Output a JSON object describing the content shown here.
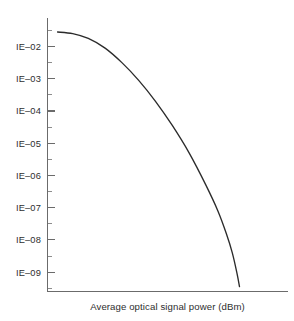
{
  "chart_data": {
    "type": "line",
    "title": "",
    "subtitle": "",
    "xlabel": "Average optical signal power (dBm)",
    "ylabel": "",
    "grid": false,
    "legend": null,
    "legend_position": "none",
    "yscale": "log",
    "xscale": "linear",
    "y_tick_labels": [
      "IE–02",
      "IE–03",
      "IE–04",
      "IE–05",
      "IE–06",
      "IE–07",
      "IE–08",
      "IE–09"
    ],
    "y_tick_values": [
      0.01,
      0.001,
      0.0001,
      1e-05,
      1e-06,
      1e-07,
      1e-08,
      1e-09
    ],
    "y_minor_ticks_per_decade": 1,
    "x_tick_labels": [],
    "ylim_exponent": [
      -9.6,
      -1.1
    ],
    "xlim": [
      0,
      1
    ],
    "series": [
      {
        "name": "bit error rate curve",
        "color": "#2b2b2b",
        "x": [
          0.042,
          0.105,
          0.17,
          0.24,
          0.31,
          0.38,
          0.45,
          0.52,
          0.59,
          0.66,
          0.71,
          0.745,
          0.77,
          0.79,
          0.8
        ],
        "y_exponent": [
          -1.55,
          -1.6,
          -1.75,
          -2.05,
          -2.5,
          -3.05,
          -3.7,
          -4.45,
          -5.3,
          -6.3,
          -7.1,
          -7.8,
          -8.4,
          -9.05,
          -9.45
        ]
      }
    ]
  },
  "axes": {
    "y_axis_name": "bit-error-rate-axis",
    "x_axis_name": "optical-power-axis",
    "tick_direction": "inward"
  },
  "colors": {
    "background": "#ffffff",
    "axis": "#6b6b6b",
    "tick_minor": "#8d8d8d",
    "curve": "#2b2b2b",
    "text": "#2e2e2e"
  }
}
